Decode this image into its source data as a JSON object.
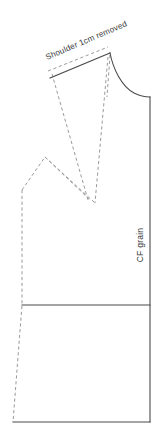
{
  "diagram": {
    "type": "sewing-pattern-block",
    "background_color": "#ffffff",
    "solid_line_color": "#4a4a4a",
    "dashed_line_color": "#9a9a9a",
    "text_color": "#3b3b3b"
  },
  "annotations": {
    "shoulder_note": {
      "text": "Shoulder 1cm removed",
      "rotation_deg": -23,
      "x": 47,
      "y": 60
    },
    "grain_label": {
      "text": "CF grain",
      "rotation_deg": -90,
      "x": 143,
      "y": 245
    }
  },
  "geometry": {
    "solid": {
      "shoulder_seam": "M 50,78 L 110,53",
      "neckline_curve": "M 110,53 C 113,68 121,86 134,93 C 140,96 146,97 150,97",
      "centre_front": "M 150,97 L 150,422",
      "waistline": "M 22,305 L 150,305",
      "hem": "M 13,422 L 150,422"
    },
    "dashed": {
      "original_shoulder": "M 48,71 L 108,47",
      "dart_left_leg": "M 52,74 L 88,200",
      "dart_right_leg": "M 108,57 L 95,203",
      "neck_dashed_drop": "M 110,55 L 107,97",
      "armhole_upper": "M 45,157 L 90,200",
      "armhole_lower": "M 45,157 L 95,203",
      "shoulder_slope_left": "M 22,190 L 45,157",
      "side_seam": "M 22,190 L 22,305 L 13,422"
    }
  }
}
